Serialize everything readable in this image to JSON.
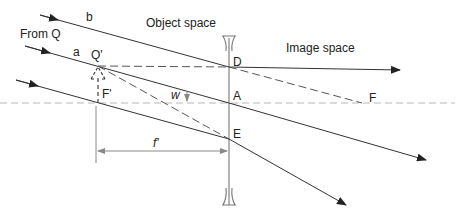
{
  "labels": {
    "from_q": "From Q",
    "object_space": "Object space",
    "image_space": "Image space",
    "ray_a": "a",
    "ray_b": "b",
    "q_prime": "Q'",
    "f_prime": "F'",
    "d": "D",
    "a_point": "A",
    "e": "E",
    "f": "F",
    "w": "w",
    "f_distance": "f'"
  },
  "colors": {
    "ray": "#333333",
    "construction_dashed": "#555555",
    "axis": "#b0b0b0",
    "lens": "#777777",
    "dimension": "#888888"
  },
  "elements": {
    "lens": "diverging (concave) lens, vertical at center",
    "optical_axis": "horizontal dashed line",
    "rays": [
      "ray b through D",
      "ray a through A",
      "lower ray through E"
    ],
    "virtual_image": "dashed arrow F' to Q'"
  }
}
